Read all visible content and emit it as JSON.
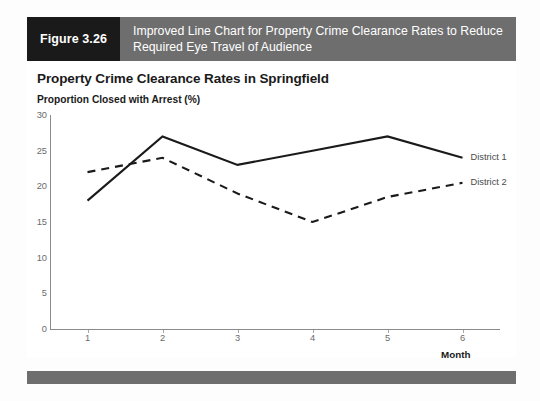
{
  "figure": {
    "number_label": "Figure 3.26",
    "title": "Improved Line Chart for Property Crime Clearance Rates to Reduce Required Eye Travel of Audience",
    "header_number_color": "#1a1a1a",
    "header_title_color": "#6e6e6e",
    "footer_color": "#6e6e6e"
  },
  "chart_data": {
    "type": "line",
    "title": "Property Crime Clearance Rates in Springfield",
    "subtitle": "Proportion Closed with Arrest (%)",
    "xlabel": "Month",
    "ylabel": "",
    "x": [
      1,
      2,
      3,
      4,
      5,
      6
    ],
    "xticklabels": [
      "1",
      "2",
      "3",
      "4",
      "5",
      "6"
    ],
    "yticklabels": [
      "0",
      "5",
      "10",
      "15",
      "20",
      "25",
      "30"
    ],
    "yticks": [
      0,
      5,
      10,
      15,
      20,
      25,
      30
    ],
    "ylim": [
      0,
      30
    ],
    "xlim": [
      0.5,
      6.5
    ],
    "grid": false,
    "legend_position": "right-of-line-ends",
    "series": [
      {
        "name": "District 1",
        "values": [
          18,
          27,
          23,
          25,
          27,
          24
        ],
        "style": "solid",
        "color": "#1a1a1a"
      },
      {
        "name": "District 2",
        "values": [
          22,
          24,
          19,
          15,
          18.5,
          20.5
        ],
        "style": "dashed",
        "color": "#1a1a1a"
      }
    ]
  }
}
